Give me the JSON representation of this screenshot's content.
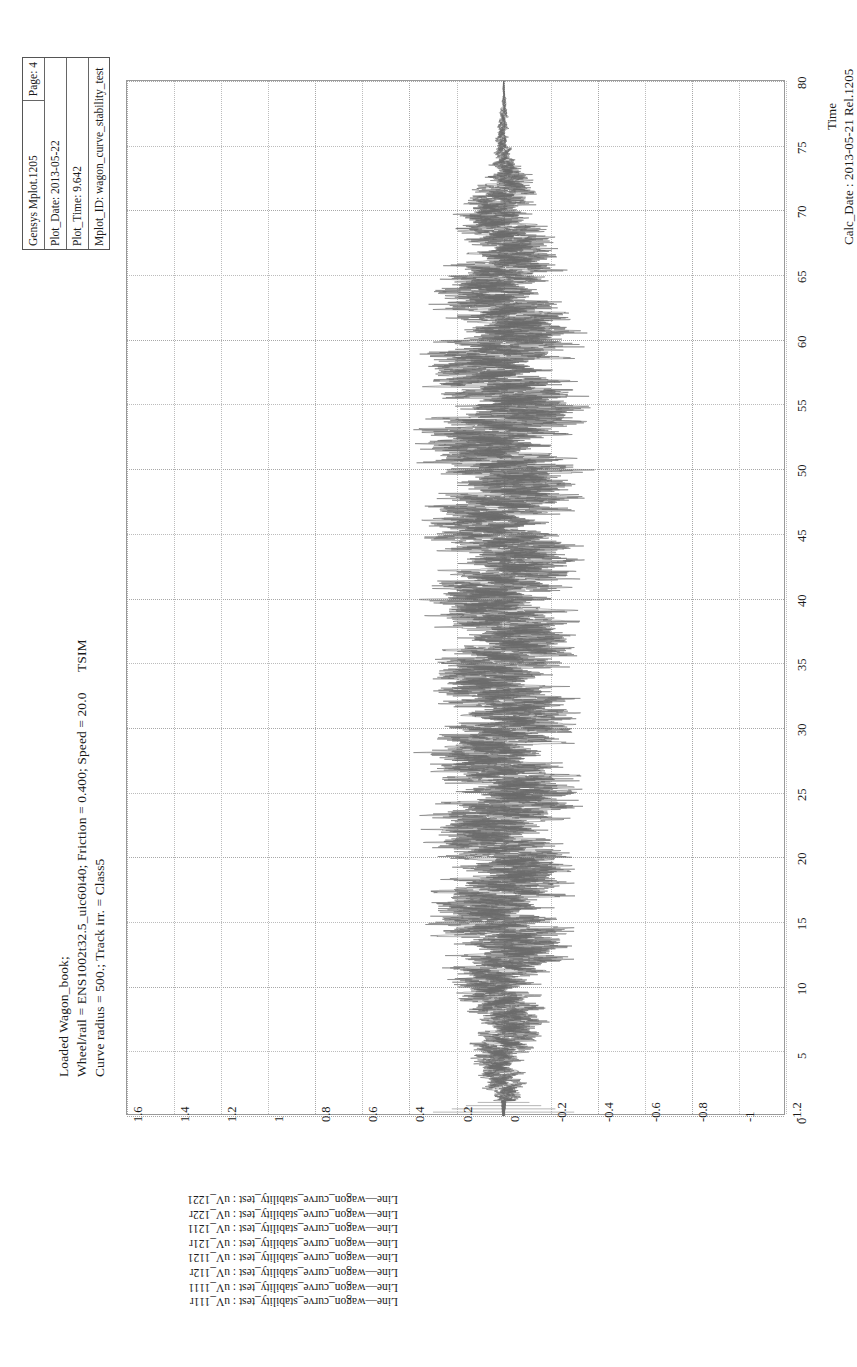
{
  "header_box": {
    "lines": [
      "Gensys Mplot.1205",
      "Plot_Date: 2013-05-22",
      "Plot_Time: 9.642",
      "Mplot_ID: wagon_curve_stability_test"
    ],
    "page_label": "Page: 4"
  },
  "title": {
    "tsim": "TSIM",
    "line1": "Loaded Wagon_book;",
    "line2": "Wheel/rail = ENS1002t32.5_uic60i40; Friction = 0.400; Speed = 20.0",
    "line3": "Curve radius = 500.; Track irr. = Class5"
  },
  "footer": {
    "x_axis_label": "Time",
    "calc_date": "Calc_Date : 2013-05-21 Rel.1205"
  },
  "legend": {
    "entries": [
      "Line—wagon_curve_stability_test : uV_1221",
      "Line—wagon_curve_stability_test : uV_122r",
      "Line—wagon_curve_stability_test : uV_1211",
      "Line—wagon_curve_stability_test : uV_121r",
      "Line—wagon_curve_stability_test : uV_1121",
      "Line—wagon_curve_stability_test : uV_112r",
      "Line—wagon_curve_stability_test : uV_1111",
      "Line—wagon_curve_stability_test : uV_111r"
    ]
  },
  "colors": {
    "trace": "#6b6b6b",
    "frame": "#9a9a9a",
    "grid": "#bcbcbc",
    "text": "#1a1a1a",
    "background": "#ffffff"
  },
  "chart_data": {
    "type": "line",
    "title": "TSIM",
    "xlabel": "Time",
    "ylabel": "",
    "xlim": [
      0,
      80
    ],
    "ylim": [
      -1.2,
      1.6
    ],
    "grid": true,
    "legend_position": "bottom-left",
    "orientation": "rotated-90-ccw",
    "x_ticks": [
      0,
      5,
      10,
      15,
      20,
      25,
      30,
      35,
      40,
      45,
      50,
      55,
      60,
      65,
      70,
      75,
      80
    ],
    "y_ticks": [
      1.6,
      1.4,
      1.2,
      1,
      0.8,
      0.6,
      0.4,
      0.2,
      0,
      -0.2,
      -0.4,
      -0.6,
      -0.8,
      -1,
      -1.2
    ],
    "x_tick_labels": [
      "0",
      "5",
      "10",
      "15",
      "20",
      "25",
      "30",
      "35",
      "40",
      "45",
      "50",
      "55",
      "60",
      "65",
      "70",
      "75",
      "80"
    ],
    "y_tick_labels": [
      "1.6",
      "1.4",
      "1.2",
      "1",
      "0.8",
      "0.6",
      "0.4",
      "0.2",
      "0",
      "-0.2",
      "-0.4",
      "-0.6",
      "-0.8",
      "-1",
      "-1.2"
    ],
    "series": [
      {
        "name": "uV_1221",
        "envelope_amplitude": 0.23,
        "seed": 1
      },
      {
        "name": "uV_122r",
        "envelope_amplitude": 0.22,
        "seed": 2
      },
      {
        "name": "uV_1211",
        "envelope_amplitude": 0.24,
        "seed": 3
      },
      {
        "name": "uV_121r",
        "envelope_amplitude": 0.21,
        "seed": 4
      },
      {
        "name": "uV_1121",
        "envelope_amplitude": 0.25,
        "seed": 5
      },
      {
        "name": "uV_112r",
        "envelope_amplitude": 0.2,
        "seed": 6
      },
      {
        "name": "uV_1111",
        "envelope_amplitude": 0.24,
        "seed": 7
      },
      {
        "name": "uV_111r",
        "envelope_amplitude": 0.22,
        "seed": 8
      }
    ],
    "envelope_keypoints": [
      {
        "t": 0,
        "amp": 0.02
      },
      {
        "t": 2,
        "amp": 0.06
      },
      {
        "t": 6,
        "amp": 0.11
      },
      {
        "t": 10,
        "amp": 0.14
      },
      {
        "t": 14,
        "amp": 0.22
      },
      {
        "t": 18,
        "amp": 0.2
      },
      {
        "t": 24,
        "amp": 0.22
      },
      {
        "t": 30,
        "amp": 0.21
      },
      {
        "t": 38,
        "amp": 0.22
      },
      {
        "t": 46,
        "amp": 0.22
      },
      {
        "t": 54,
        "amp": 0.25
      },
      {
        "t": 58,
        "amp": 0.23
      },
      {
        "t": 64,
        "amp": 0.19
      },
      {
        "t": 68,
        "amp": 0.15
      },
      {
        "t": 72,
        "amp": 0.1
      },
      {
        "t": 74,
        "amp": 0.03
      },
      {
        "t": 80,
        "amp": 0.0
      }
    ]
  }
}
